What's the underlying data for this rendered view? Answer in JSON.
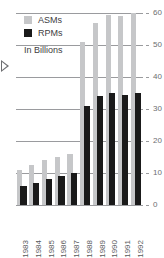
{
  "chart_data": {
    "type": "bar",
    "title": "",
    "subtitle": "In Billions",
    "xlabel": "",
    "ylabel": "",
    "ylim": [
      0,
      60
    ],
    "yticks": [
      0,
      10,
      20,
      30,
      40,
      50,
      60
    ],
    "ytick_labels": [
      "0",
      "10",
      "20",
      "30",
      "40",
      "50",
      "60"
    ],
    "grid": true,
    "legend_position": "top-left",
    "categories": [
      "1983",
      "1984",
      "1985",
      "1986",
      "1987",
      "1988",
      "1989",
      "1990",
      "1991",
      "1992"
    ],
    "series": [
      {
        "name": "ASMs",
        "color": "#c6c7c9",
        "values": [
          11,
          12.5,
          14,
          15,
          16,
          51,
          57,
          59.5,
          59,
          60
        ]
      },
      {
        "name": "RPMs",
        "color": "#1a1a1a",
        "values": [
          6,
          7,
          8,
          9,
          10,
          31,
          34,
          35,
          34.5,
          35
        ]
      }
    ]
  },
  "legend": {
    "items": [
      {
        "label": "ASMs"
      },
      {
        "label": "RPMs"
      }
    ]
  },
  "subtitle": "In Billions",
  "colors": {
    "asm": "#c6c7c9",
    "rpm": "#1a1a1a",
    "gridline": "#9a9b9e",
    "axis_text": "#6d6e71",
    "background": "#ffffff"
  }
}
